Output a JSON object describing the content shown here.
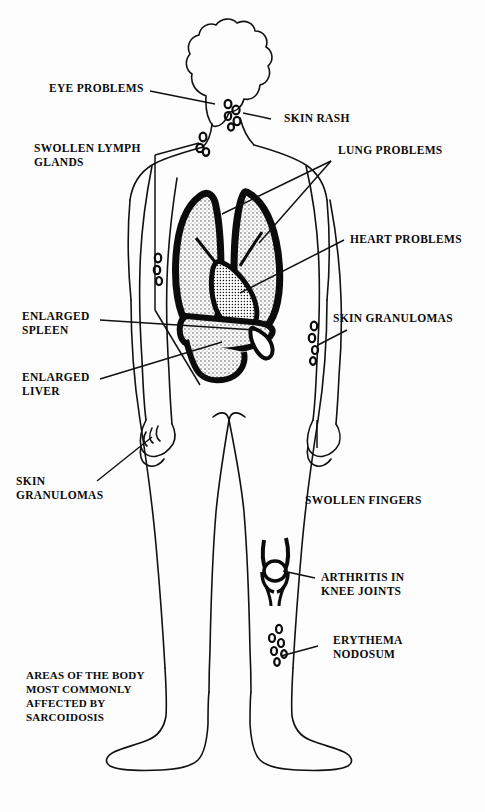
{
  "diagram": {
    "title_caption": "AREAS OF THE BODY\nMOST COMMONLY\nAFFECTED BY\nSARCOIDOSIS",
    "ink_color": "#0b0b0b",
    "background_color": "#fdfdfd",
    "labels": [
      {
        "id": "eye-problems",
        "text": "EYE PROBLEMS",
        "side": "left"
      },
      {
        "id": "swollen-lymph",
        "text": "SWOLLEN LYMPH\nGLANDS",
        "side": "left"
      },
      {
        "id": "enlarged-spleen",
        "text": "ENLARGED\nSPLEEN",
        "side": "left"
      },
      {
        "id": "enlarged-liver",
        "text": "ENLARGED\nLIVER",
        "side": "left"
      },
      {
        "id": "skin-granulomas-left",
        "text": "SKIN\nGRANULOMAS",
        "side": "left"
      },
      {
        "id": "skin-rash",
        "text": "SKIN RASH",
        "side": "right"
      },
      {
        "id": "lung-problems",
        "text": "LUNG PROBLEMS",
        "side": "right"
      },
      {
        "id": "heart-problems",
        "text": "HEART PROBLEMS",
        "side": "right"
      },
      {
        "id": "skin-granulomas-right",
        "text": "SKIN GRANULOMAS",
        "side": "right"
      },
      {
        "id": "swollen-fingers",
        "text": "SWOLLEN FINGERS",
        "side": "right"
      },
      {
        "id": "arthritis-knee",
        "text": "ARTHRITIS IN\nKNEE JOINTS",
        "side": "right"
      },
      {
        "id": "erythema-nodosum",
        "text": "ERYTHEMA\nNODOSUM",
        "side": "right"
      }
    ],
    "anatomy_parts": [
      "head",
      "neck",
      "torso",
      "left-arm",
      "right-arm",
      "left-leg",
      "right-leg",
      "left-foot",
      "right-foot",
      "lungs",
      "heart",
      "liver",
      "spleen",
      "knee-joint",
      "lymph-nodes",
      "rash-spots",
      "granuloma-spots"
    ]
  }
}
